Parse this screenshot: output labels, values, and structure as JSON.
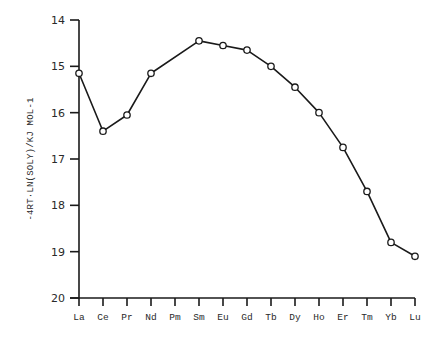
{
  "chart_data": {
    "type": "line",
    "title": "",
    "xlabel": "",
    "ylabel": "-4RT·LN(SOLY)/KJ MOL-1",
    "categories": [
      "La",
      "Ce",
      "Pr",
      "Nd",
      "Pm",
      "Sm",
      "Eu",
      "Gd",
      "Tb",
      "Dy",
      "Ho",
      "Er",
      "Tm",
      "Yb",
      "Lu"
    ],
    "series": [
      {
        "name": "-4RT·ln(soly)",
        "values": [
          15.15,
          16.4,
          16.05,
          15.15,
          null,
          14.45,
          14.55,
          14.65,
          15.0,
          15.45,
          16.0,
          16.75,
          17.7,
          18.8,
          19.1
        ],
        "marker": "open-circle",
        "color": "#1a1a1a"
      }
    ],
    "ylim": [
      14,
      20
    ],
    "y_inverted": true,
    "yticks": [
      14,
      15,
      16,
      17,
      18,
      19,
      20
    ],
    "grid": false,
    "legend": null
  },
  "layout": {
    "plot_left": 79,
    "plot_right": 415,
    "plot_top": 20,
    "plot_bottom": 298
  }
}
